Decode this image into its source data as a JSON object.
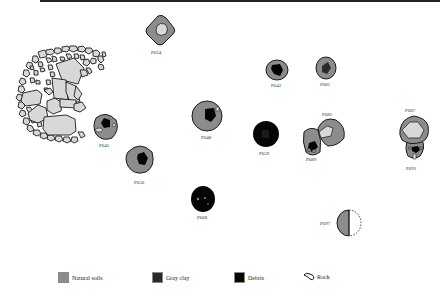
{
  "colors": {
    "natural_soils": "#8c8c8c",
    "gray_clay": "#2a2a2a",
    "debris": "#050505",
    "rock": "#d8d8d8",
    "outline": "#1a1a1a"
  },
  "features": [
    {
      "id": "P624",
      "label": "P624"
    },
    {
      "id": "P642",
      "label": "P642"
    },
    {
      "id": "P681",
      "label": "P681"
    },
    {
      "id": "P645",
      "label": "P645"
    },
    {
      "id": "P648",
      "label": "P648"
    },
    {
      "id": "P659",
      "label": "P659"
    },
    {
      "id": "P685",
      "label": "P685"
    },
    {
      "id": "P689",
      "label": "P689"
    },
    {
      "id": "P687",
      "label": "P687"
    },
    {
      "id": "P691",
      "label": "P691"
    },
    {
      "id": "P656",
      "label": "P656"
    },
    {
      "id": "P668",
      "label": "P668"
    },
    {
      "id": "P697",
      "label": "P697"
    }
  ],
  "legend": [
    {
      "key": "natural_soils",
      "label": "Natural soils"
    },
    {
      "key": "gray_clay",
      "label": "Gray clay"
    },
    {
      "key": "debris",
      "label": "Debris"
    },
    {
      "key": "rock",
      "label": "Rock"
    }
  ]
}
